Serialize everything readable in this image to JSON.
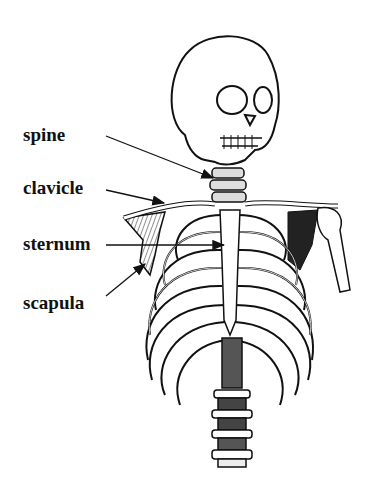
{
  "diagram": {
    "labels": [
      {
        "id": "spine",
        "text": "spine"
      },
      {
        "id": "clavicle",
        "text": "clavicle"
      },
      {
        "id": "sternum",
        "text": "sternum"
      },
      {
        "id": "scapula",
        "text": "scapula"
      }
    ]
  },
  "colors": {
    "ink": "#111111",
    "background": "#ffffff"
  }
}
